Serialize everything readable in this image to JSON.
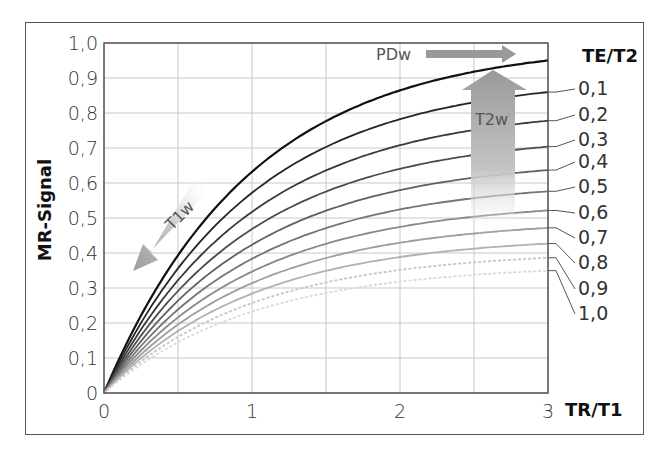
{
  "chart_data": {
    "type": "line",
    "title": "",
    "xlabel": "TR/T1",
    "ylabel": "MR-Signal",
    "legend_title": "TE/T2",
    "xlim": [
      0,
      3
    ],
    "ylim": [
      0,
      1.0
    ],
    "grid": true,
    "x_ticks": [
      "0",
      "1",
      "2",
      "3"
    ],
    "x_gridlines": [
      0,
      0.5,
      1,
      1.5,
      2,
      2.5,
      3
    ],
    "y_ticks": [
      "0",
      "0,1",
      "0,2",
      "0,3",
      "0,4",
      "0,5",
      "0,6",
      "0,7",
      "0,8",
      "0,9",
      "1,0"
    ],
    "formula": "S = (1 - exp(-TR/T1)) * exp(-TE/T2)",
    "x": [
      0,
      0.5,
      1,
      1.5,
      2,
      2.5,
      3
    ],
    "series": [
      {
        "name": "0",
        "values": [
          0,
          0.39,
          0.63,
          0.78,
          0.86,
          0.92,
          0.95
        ]
      },
      {
        "name": "0,1",
        "values": [
          0,
          0.36,
          0.57,
          0.7,
          0.78,
          0.83,
          0.86
        ]
      },
      {
        "name": "0,2",
        "values": [
          0,
          0.32,
          0.52,
          0.64,
          0.71,
          0.75,
          0.78
        ]
      },
      {
        "name": "0,3",
        "values": [
          0,
          0.29,
          0.47,
          0.57,
          0.64,
          0.68,
          0.7
        ]
      },
      {
        "name": "0,4",
        "values": [
          0,
          0.26,
          0.42,
          0.52,
          0.58,
          0.61,
          0.64
        ]
      },
      {
        "name": "0,5",
        "values": [
          0,
          0.24,
          0.38,
          0.47,
          0.52,
          0.56,
          0.58
        ]
      },
      {
        "name": "0,6",
        "values": [
          0,
          0.22,
          0.35,
          0.43,
          0.47,
          0.5,
          0.52
        ]
      },
      {
        "name": "0,7",
        "values": [
          0,
          0.2,
          0.31,
          0.39,
          0.43,
          0.45,
          0.47
        ]
      },
      {
        "name": "0,8",
        "values": [
          0,
          0.18,
          0.28,
          0.35,
          0.39,
          0.41,
          0.43
        ]
      },
      {
        "name": "0,9",
        "values": [
          0,
          0.16,
          0.26,
          0.32,
          0.35,
          0.37,
          0.39
        ]
      },
      {
        "name": "1,0",
        "values": [
          0,
          0.14,
          0.23,
          0.29,
          0.32,
          0.34,
          0.35
        ]
      }
    ],
    "annotations": [
      {
        "text": "PDw",
        "arrow": "right"
      },
      {
        "text": "T2w",
        "arrow": "up"
      },
      {
        "text": "T1w",
        "arrow": "down-left"
      }
    ]
  },
  "labels": {
    "ylabel": "MR-Signal",
    "xlabel": "TR/T1",
    "legend_title": "TE/T2",
    "pdw": "PDw",
    "t2w": "T2w",
    "t1w": "T1w"
  }
}
